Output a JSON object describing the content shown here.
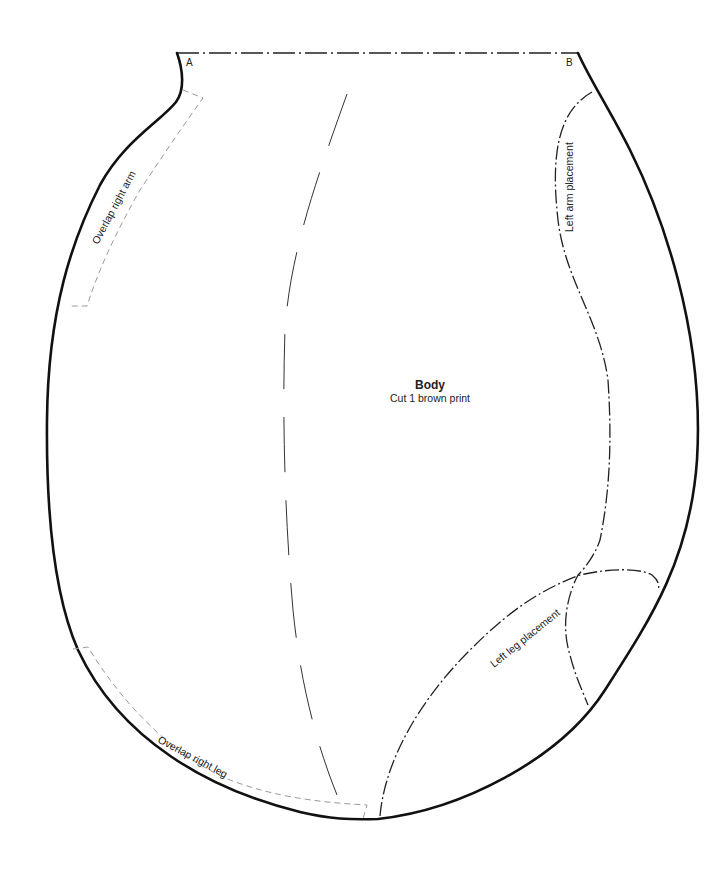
{
  "pattern_piece": {
    "name": "Body",
    "instruction": "Cut 1 brown print",
    "corners": {
      "a": "A",
      "b": "B"
    },
    "labels": {
      "overlap_arm": "Overlap right arm",
      "overlap_leg": "Overlap right leg",
      "arm_placement": "Left arm placement",
      "leg_placement": "Left leg placement"
    },
    "line_styles": {
      "cut_line": "solid",
      "fold_line": "dash-dot",
      "grainline": "long-dash",
      "placement_lines": "dash-dot",
      "overlap_lines": "gray-dashed"
    },
    "colors": {
      "outline": "#111111",
      "overlap": "#9a9a9a",
      "background": "#ffffff"
    }
  }
}
